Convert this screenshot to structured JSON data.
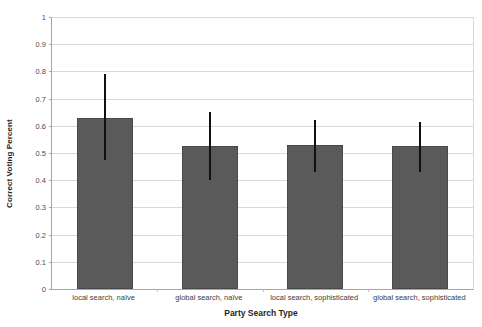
{
  "chart_data": {
    "type": "bar",
    "title": "",
    "xlabel": "Party Search Type",
    "ylabel": "Correct Voting Percent",
    "categories": [
      "local search, naïve",
      "global search, naïve",
      "local search, sophisticated",
      "global search, sophisticated"
    ],
    "values": [
      0.63,
      0.525,
      0.53,
      0.525
    ],
    "error_low": [
      0.475,
      0.4,
      0.43,
      0.43
    ],
    "error_high": [
      0.79,
      0.65,
      0.62,
      0.615
    ],
    "ylim": [
      0,
      1
    ],
    "yticks": [
      0,
      0.1,
      0.2,
      0.3,
      0.4,
      0.5,
      0.6,
      0.7,
      0.8,
      0.9,
      1
    ],
    "ytick_labels": [
      "0",
      "0.1",
      "0.2",
      "0.3",
      "0.4",
      "0.5",
      "0.6",
      "0.7",
      "0.8",
      "0.9",
      "1"
    ],
    "grid": true,
    "legend": false,
    "legend_position": "none",
    "bar_color": "#5a5a5a",
    "errorbar_color": "#111111",
    "gridline_color": "#d9d9d9",
    "axis_color": "#a6a6a6",
    "background": "#ffffff"
  }
}
